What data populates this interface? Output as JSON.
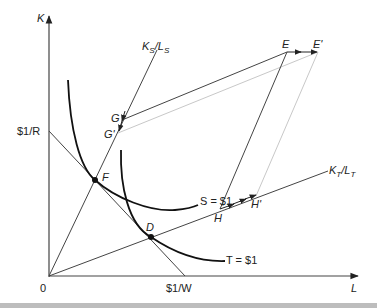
{
  "diagram": {
    "axes": {
      "y_label": "K",
      "x_label": "L",
      "origin_label": "0"
    },
    "intercepts": {
      "k_intercept": "$1/R",
      "l_intercept": "$1/W"
    },
    "rays": {
      "s_ray": {
        "label_main": "K",
        "label_sub": "S",
        "label_sep": "/",
        "label_main2": "L",
        "label_sub2": "S"
      },
      "t_ray": {
        "label_main": "K",
        "label_sub": "T",
        "label_sep": "/",
        "label_main2": "L",
        "label_sub2": "T"
      }
    },
    "isoquants": {
      "s": "S = $1",
      "t": "T = $1"
    },
    "points": {
      "F": "F",
      "D": "D",
      "G": "G",
      "G_prime": "G'",
      "E": "E",
      "E_prime": "E'",
      "H": "H",
      "H_prime": "H'"
    },
    "colors": {
      "ink": "#222222",
      "shifted": "#c8c8c8"
    }
  }
}
